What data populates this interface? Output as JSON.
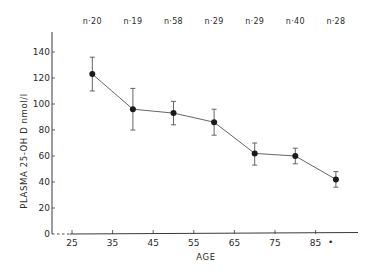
{
  "chart_data": {
    "type": "line",
    "title": "",
    "xlabel": "AGE",
    "ylabel": "PLASMA  25-OH  D   nmol/l",
    "xlim": [
      22,
      95
    ],
    "ylim": [
      0,
      150
    ],
    "grid": false,
    "legend": null,
    "x_ticks": [
      25,
      35,
      45,
      55,
      65,
      75,
      85
    ],
    "x_tick_labels": [
      "25",
      "35",
      "45",
      "55",
      "65",
      "75",
      "85"
    ],
    "x_tail_marker": "•",
    "y_ticks": [
      0,
      20,
      40,
      60,
      80,
      100,
      120,
      140
    ],
    "y_tick_labels": [
      "0",
      "20",
      "40",
      "60",
      "80",
      "100",
      "120",
      "140"
    ],
    "x": [
      30,
      40,
      50,
      60,
      70,
      80,
      90
    ],
    "series": [
      {
        "name": "Plasma 25-OH D",
        "values": [
          123,
          96,
          93,
          86,
          62,
          60,
          42
        ],
        "error_upper": [
          136,
          112,
          102,
          96,
          70,
          66,
          48
        ],
        "error_lower": [
          110,
          80,
          84,
          76,
          53,
          54,
          36
        ],
        "marker": "filled-circle",
        "color": "#1a1a1a"
      }
    ],
    "annotations": [
      "n·20",
      "n·19",
      "n·58",
      "n·29",
      "n·29",
      "n·40",
      "n·28"
    ]
  },
  "layout": {
    "axis_color": "#3a3a3a",
    "line_color": "#555555"
  }
}
